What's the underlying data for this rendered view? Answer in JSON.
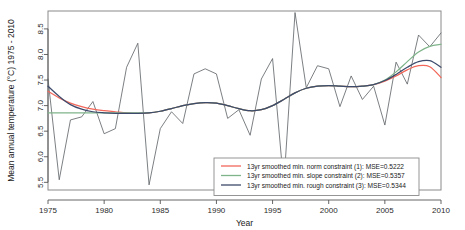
{
  "chart_data": {
    "type": "line",
    "title": "",
    "xlabel": "Year",
    "ylabel": "Mean annual temperature (°C) 1975 - 2010",
    "xlim": [
      1975,
      2010
    ],
    "ylim": [
      5.35,
      8.85
    ],
    "xticks": [
      1975,
      1980,
      1985,
      1990,
      1995,
      2000,
      2005,
      2010
    ],
    "xticklabels": [
      "1975",
      "1980",
      "1985",
      "1990",
      "1995",
      "2000",
      "2005",
      "2010"
    ],
    "yticks": [
      5.5,
      6.0,
      6.5,
      7.0,
      7.5,
      8.0,
      8.5
    ],
    "yticklabels": [
      "5.5",
      "6.0",
      "6.5",
      "7.0",
      "7.5",
      "8.0",
      "8.5"
    ],
    "grid": false,
    "legend_position": "bottom-right",
    "x": [
      1975,
      1976,
      1977,
      1978,
      1979,
      1980,
      1981,
      1982,
      1983,
      1984,
      1985,
      1986,
      1987,
      1988,
      1989,
      1990,
      1991,
      1992,
      1993,
      1994,
      1995,
      1996,
      1997,
      1998,
      1999,
      2000,
      2001,
      2002,
      2003,
      2004,
      2005,
      2006,
      2007,
      2008,
      2009,
      2010
    ],
    "series": [
      {
        "name": "raw",
        "label": "Mean annual temperature",
        "color": "#5a5f63",
        "in_legend": false,
        "values": [
          7.52,
          5.55,
          6.72,
          6.78,
          7.08,
          6.45,
          6.55,
          7.75,
          8.22,
          5.45,
          6.55,
          6.88,
          6.65,
          7.62,
          7.72,
          7.62,
          6.75,
          6.92,
          6.42,
          7.52,
          7.92,
          5.45,
          8.82,
          7.35,
          7.78,
          7.72,
          6.98,
          7.58,
          7.12,
          7.38,
          6.62,
          7.85,
          7.42,
          8.38,
          8.15,
          8.42
        ]
      },
      {
        "name": "norm",
        "label": "13yr smoothed min. norm constraint (1): MSE=0.5222",
        "color": "#f2675a",
        "in_legend": true,
        "mse": 0.5222,
        "values": [
          7.28,
          7.15,
          7.05,
          6.98,
          6.93,
          6.9,
          6.88,
          6.86,
          6.85,
          6.86,
          6.89,
          6.94,
          7.0,
          7.04,
          7.06,
          7.05,
          7.0,
          6.94,
          6.9,
          6.92,
          7.0,
          7.12,
          7.25,
          7.34,
          7.38,
          7.39,
          7.38,
          7.37,
          7.38,
          7.41,
          7.48,
          7.58,
          7.7,
          7.78,
          7.76,
          7.55
        ]
      },
      {
        "name": "slope",
        "label": "13yr smoothed min. slope constraint (2): MSE=0.5357",
        "color": "#7fb48a",
        "in_legend": true,
        "mse": 0.5357,
        "values": [
          6.86,
          6.86,
          6.86,
          6.86,
          6.86,
          6.86,
          6.86,
          6.86,
          6.86,
          6.86,
          6.89,
          6.94,
          7.0,
          7.04,
          7.06,
          7.05,
          7.0,
          6.94,
          6.9,
          6.92,
          7.0,
          7.12,
          7.25,
          7.34,
          7.38,
          7.39,
          7.38,
          7.37,
          7.38,
          7.41,
          7.5,
          7.66,
          7.86,
          8.05,
          8.16,
          8.2
        ]
      },
      {
        "name": "rough",
        "label": "13yr smoothed min. rough constraint (3): MSE=0.5344",
        "color": "#3d4a6b",
        "in_legend": true,
        "mse": 0.5344,
        "values": [
          7.38,
          7.18,
          7.02,
          6.93,
          6.88,
          6.86,
          6.85,
          6.85,
          6.85,
          6.86,
          6.89,
          6.94,
          7.0,
          7.04,
          7.06,
          7.05,
          7.0,
          6.94,
          6.9,
          6.92,
          7.0,
          7.12,
          7.25,
          7.34,
          7.38,
          7.39,
          7.38,
          7.37,
          7.38,
          7.41,
          7.49,
          7.61,
          7.75,
          7.86,
          7.88,
          7.75
        ]
      }
    ]
  }
}
